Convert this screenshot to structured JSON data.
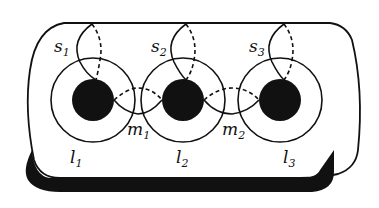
{
  "diagram": {
    "type": "surface-curves",
    "colors": {
      "ink": "#111111",
      "background": "#ffffff"
    },
    "holes": [
      {
        "id": "hole-1",
        "cx": 93,
        "cy": 100
      },
      {
        "id": "hole-2",
        "cx": 183,
        "cy": 100
      },
      {
        "id": "hole-3",
        "cx": 280,
        "cy": 100
      }
    ],
    "labels": {
      "s1": {
        "base": "s",
        "sub": "1"
      },
      "s2": {
        "base": "s",
        "sub": "2"
      },
      "s3": {
        "base": "s",
        "sub": "3"
      },
      "m1": {
        "base": "m",
        "sub": "1"
      },
      "m2": {
        "base": "m",
        "sub": "2"
      },
      "l1": {
        "base": "l",
        "sub": "1"
      },
      "l2": {
        "base": "l",
        "sub": "2"
      },
      "l3": {
        "base": "l",
        "sub": "3"
      }
    }
  }
}
